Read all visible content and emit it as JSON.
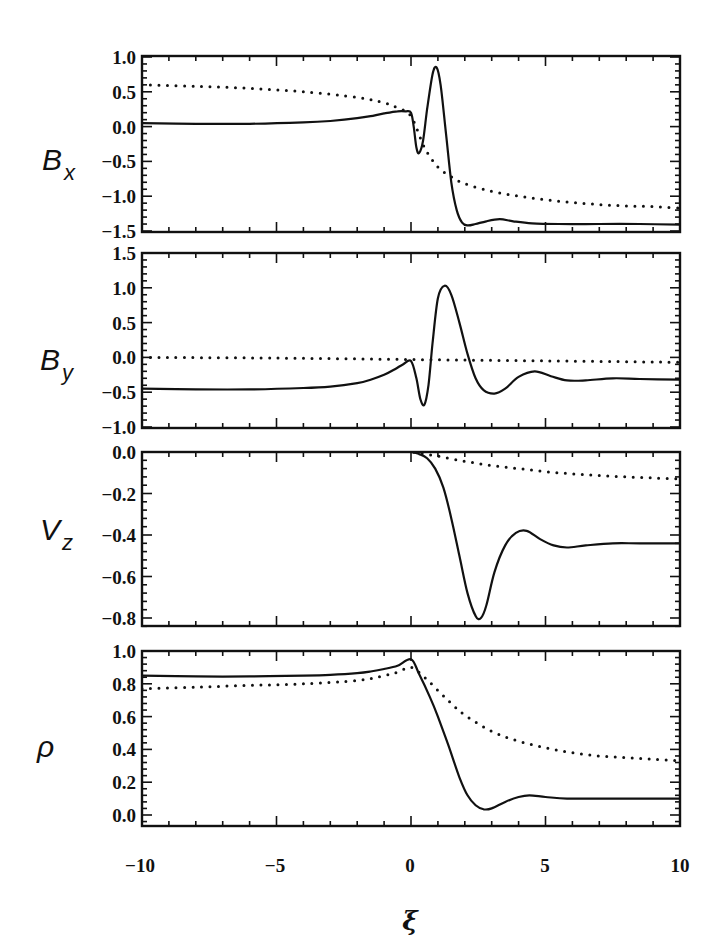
{
  "chart_data": [
    {
      "type": "line",
      "ylabel": "B_x",
      "ylabel_main": "B",
      "ylabel_sub": "x",
      "xlim": [
        -10,
        10
      ],
      "ylim": [
        -1.5,
        1.0
      ],
      "yticks": [
        1.0,
        0.5,
        0.0,
        -0.5,
        -1.0,
        -1.5
      ],
      "ytick_labels": [
        "1.0",
        "0.5",
        "0.0",
        "−0.5",
        "−1.0",
        "−1.5"
      ],
      "grid": false,
      "series": [
        {
          "name": "solid",
          "style": "solid",
          "x": [
            -10,
            -8,
            -6,
            -4,
            -3,
            -2,
            -1.5,
            -1,
            -0.5,
            -0.2,
            0,
            0.1,
            0.2,
            0.3,
            0.45,
            0.6,
            0.8,
            0.95,
            1.1,
            1.3,
            1.5,
            1.7,
            1.9,
            2.1,
            2.4,
            2.8,
            3.3,
            3.8,
            4.5,
            5.5,
            7,
            8.5,
            10
          ],
          "y": [
            0.05,
            0.04,
            0.04,
            0.06,
            0.08,
            0.12,
            0.15,
            0.19,
            0.22,
            0.22,
            0.2,
            0.0,
            -0.3,
            -0.38,
            -0.2,
            0.25,
            0.75,
            0.85,
            0.6,
            -0.1,
            -0.8,
            -1.2,
            -1.38,
            -1.42,
            -1.4,
            -1.36,
            -1.33,
            -1.36,
            -1.39,
            -1.4,
            -1.4,
            -1.4,
            -1.41
          ]
        },
        {
          "name": "dotted",
          "style": "dotted",
          "x": [
            -10,
            -8,
            -6,
            -4,
            -2,
            -1,
            -0.5,
            0,
            0.5,
            1,
            1.5,
            2,
            3,
            4,
            5,
            6,
            7,
            8,
            9,
            10
          ],
          "y": [
            0.6,
            0.58,
            0.55,
            0.5,
            0.42,
            0.34,
            0.27,
            0.15,
            -0.3,
            -0.58,
            -0.72,
            -0.82,
            -0.93,
            -1.0,
            -1.05,
            -1.09,
            -1.12,
            -1.14,
            -1.15,
            -1.17
          ]
        }
      ]
    },
    {
      "type": "line",
      "ylabel": "B_y",
      "ylabel_main": "B",
      "ylabel_sub": "y",
      "xlim": [
        -10,
        10
      ],
      "ylim": [
        -1.0,
        1.5
      ],
      "yticks": [
        1.5,
        1.0,
        0.5,
        0.0,
        -0.5,
        -1.0
      ],
      "ytick_labels": [
        "1.5",
        "1.0",
        "0.5",
        "0.0",
        "−0.5",
        "−1.0"
      ],
      "grid": false,
      "series": [
        {
          "name": "solid",
          "style": "solid",
          "x": [
            -10,
            -8,
            -6,
            -4,
            -3,
            -2,
            -1.5,
            -1,
            -0.6,
            -0.3,
            0,
            0.2,
            0.35,
            0.5,
            0.65,
            0.8,
            1.0,
            1.25,
            1.5,
            1.8,
            2.1,
            2.4,
            2.7,
            3.1,
            3.5,
            4.0,
            4.6,
            5.2,
            5.8,
            6.5,
            7.5,
            8.5,
            10
          ],
          "y": [
            -0.45,
            -0.46,
            -0.46,
            -0.44,
            -0.42,
            -0.37,
            -0.32,
            -0.25,
            -0.17,
            -0.1,
            -0.05,
            -0.3,
            -0.6,
            -0.68,
            -0.4,
            0.2,
            0.85,
            1.03,
            0.9,
            0.5,
            0.05,
            -0.3,
            -0.47,
            -0.52,
            -0.45,
            -0.28,
            -0.2,
            -0.27,
            -0.33,
            -0.33,
            -0.3,
            -0.31,
            -0.32
          ]
        },
        {
          "name": "dotted",
          "style": "dotted",
          "x": [
            -10,
            -5,
            0,
            5,
            10
          ],
          "y": [
            0.0,
            -0.01,
            -0.03,
            -0.05,
            -0.07
          ]
        }
      ]
    },
    {
      "type": "line",
      "ylabel": "V_z",
      "ylabel_main": "V",
      "ylabel_sub": "z",
      "xlim": [
        -10,
        10
      ],
      "ylim": [
        -0.84,
        0.0
      ],
      "yticks": [
        0.0,
        -0.2,
        -0.4,
        -0.6,
        -0.8
      ],
      "ytick_labels": [
        "0.0",
        "−0.2",
        "−0.4",
        "−0.6",
        "−0.8"
      ],
      "grid": false,
      "series": [
        {
          "name": "solid",
          "style": "solid",
          "x": [
            -10,
            -5,
            -1,
            0,
            0.3,
            0.6,
            0.9,
            1.2,
            1.5,
            1.8,
            2.1,
            2.4,
            2.6,
            2.8,
            3.1,
            3.5,
            3.9,
            4.3,
            4.8,
            5.3,
            5.8,
            6.5,
            7.5,
            8.5,
            10
          ],
          "y": [
            0.01,
            0.01,
            0.01,
            0.0,
            -0.01,
            -0.03,
            -0.08,
            -0.17,
            -0.32,
            -0.5,
            -0.68,
            -0.79,
            -0.8,
            -0.74,
            -0.58,
            -0.45,
            -0.39,
            -0.38,
            -0.42,
            -0.45,
            -0.46,
            -0.45,
            -0.44,
            -0.44,
            -0.44
          ]
        },
        {
          "name": "dotted",
          "style": "dotted",
          "x": [
            -10,
            -5,
            -1,
            0,
            0.5,
            1,
            2,
            3,
            4,
            5,
            6,
            7,
            8,
            9,
            10
          ],
          "y": [
            0.01,
            0.01,
            0.01,
            0.0,
            -0.01,
            -0.02,
            -0.045,
            -0.065,
            -0.08,
            -0.095,
            -0.105,
            -0.113,
            -0.12,
            -0.125,
            -0.13
          ]
        }
      ]
    },
    {
      "type": "line",
      "ylabel": "ρ",
      "ylabel_main": "ρ",
      "ylabel_sub": "",
      "xlabel": "ξ",
      "xlim": [
        -10,
        10
      ],
      "ylim": [
        -0.02,
        1.03
      ],
      "xticks": [
        -10,
        -5,
        0,
        5,
        10
      ],
      "xtick_labels": [
        "−10",
        "−5",
        "0",
        "5",
        "10"
      ],
      "yticks": [
        1.0,
        0.8,
        0.6,
        0.4,
        0.2,
        0.0
      ],
      "ytick_labels": [
        "1.0",
        "0.8",
        "0.6",
        "0.4",
        "0.2",
        "0.0"
      ],
      "grid": false,
      "series": [
        {
          "name": "solid",
          "style": "solid",
          "x": [
            -10,
            -8,
            -6,
            -4,
            -3,
            -2,
            -1.5,
            -1,
            -0.5,
            0,
            0.3,
            0.7,
            1.0,
            1.4,
            1.8,
            2.1,
            2.4,
            2.7,
            3.0,
            3.5,
            4.0,
            4.4,
            5.0,
            5.8,
            7,
            8.5,
            10
          ],
          "y": [
            0.85,
            0.845,
            0.845,
            0.85,
            0.855,
            0.865,
            0.875,
            0.89,
            0.91,
            0.95,
            0.86,
            0.72,
            0.6,
            0.42,
            0.23,
            0.12,
            0.06,
            0.035,
            0.04,
            0.08,
            0.11,
            0.12,
            0.11,
            0.1,
            0.1,
            0.1,
            0.1
          ]
        },
        {
          "name": "dotted",
          "style": "dotted",
          "x": [
            -10,
            -8,
            -6,
            -4,
            -2,
            -1,
            -0.5,
            0,
            0.5,
            1,
            1.5,
            2,
            3,
            4,
            5,
            6,
            7,
            8,
            9,
            10
          ],
          "y": [
            0.77,
            0.78,
            0.79,
            0.8,
            0.82,
            0.85,
            0.87,
            0.9,
            0.84,
            0.76,
            0.68,
            0.61,
            0.51,
            0.45,
            0.41,
            0.38,
            0.36,
            0.35,
            0.34,
            0.33
          ]
        }
      ]
    }
  ],
  "figure": {
    "xlabel": "ξ",
    "xtick_labels": [
      "−10",
      "−5",
      "0",
      "5",
      "10"
    ]
  }
}
